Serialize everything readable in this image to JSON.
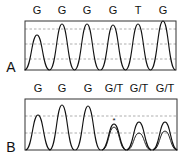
{
  "panels": [
    {
      "label": "A",
      "bases": [
        "G",
        "G",
        "G",
        "G",
        "T",
        "G"
      ],
      "box": {
        "x": 25,
        "y": 21,
        "w": 151,
        "h": 49
      },
      "gridlines": [
        29,
        44,
        59
      ],
      "peaks": [
        {
          "x": 37,
          "top": 35
        },
        {
          "x": 62,
          "top": 24
        },
        {
          "x": 87,
          "top": 24
        },
        {
          "x": 113,
          "top": 25
        },
        {
          "x": 138,
          "top": 24
        },
        {
          "x": 163,
          "top": 21
        }
      ]
    },
    {
      "label": "B",
      "bases": [
        "G",
        "G",
        "G",
        "G/T",
        "G/T",
        "G/T"
      ],
      "box": {
        "x": 25,
        "y": 99,
        "w": 152,
        "h": 51
      },
      "gridlines": [
        116,
        133
      ],
      "peaks": [
        {
          "x": 38,
          "top": 115
        },
        {
          "x": 62,
          "top": 105
        },
        {
          "x": 88,
          "top": 106
        },
        {
          "x": 114,
          "top": 124,
          "second_top": 127
        },
        {
          "x": 139,
          "top": 122,
          "second_top": 133
        },
        {
          "x": 165,
          "top": 122,
          "second_top": 131
        }
      ],
      "annotation": {
        "text": "*",
        "x": 114,
        "y": 123
      }
    }
  ],
  "colors": {
    "trace": "#111111",
    "grid": "#9a9a9a",
    "box": "#333333"
  }
}
